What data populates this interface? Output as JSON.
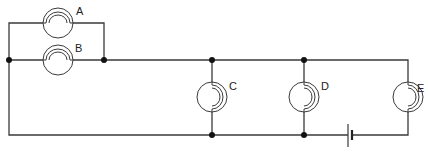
{
  "diagram": {
    "type": "circuit",
    "bulbs": [
      {
        "id": "A",
        "label": "A",
        "cx": 58,
        "cy": 23,
        "orientation": "horizontal"
      },
      {
        "id": "B",
        "label": "B",
        "cx": 58,
        "cy": 60,
        "orientation": "horizontal"
      },
      {
        "id": "C",
        "label": "C",
        "cx": 212,
        "cy": 97,
        "orientation": "vertical"
      },
      {
        "id": "D",
        "label": "D",
        "cx": 304,
        "cy": 97,
        "orientation": "vertical"
      },
      {
        "id": "E",
        "label": "E",
        "cx": 408,
        "cy": 97,
        "orientation": "vertical"
      }
    ],
    "battery": {
      "x": 350,
      "y": 135
    },
    "junctions": [
      {
        "x": 9,
        "y": 60
      },
      {
        "x": 104,
        "y": 60
      },
      {
        "x": 212,
        "y": 60
      },
      {
        "x": 304,
        "y": 60
      },
      {
        "x": 212,
        "y": 135
      },
      {
        "x": 304,
        "y": 135
      }
    ],
    "colors": {
      "wire": "#3a3a3a",
      "node": "#111111",
      "background": "#ffffff"
    }
  },
  "labels": {
    "A": "A",
    "B": "B",
    "C": "C",
    "D": "D",
    "E": "E"
  }
}
